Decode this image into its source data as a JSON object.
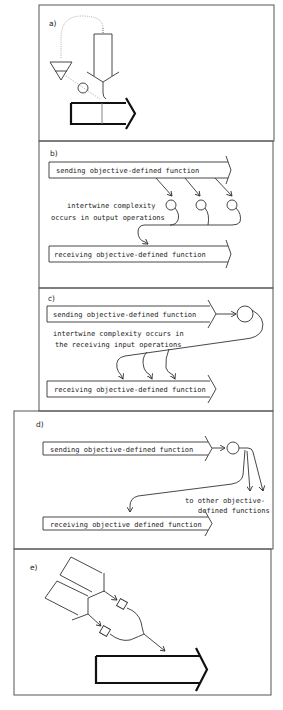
{
  "figure": {
    "colors": {
      "line": "#333333",
      "frame": "#555555",
      "background": "#ffffff"
    },
    "panels": [
      {
        "id": "a",
        "label": "a)"
      },
      {
        "id": "b",
        "label": "b)",
        "sending": "sending objective-defined function",
        "receiving": "receiving objective-defined function",
        "note_line1": "intertwine complexity",
        "note_line2": "occurs in output operations"
      },
      {
        "id": "c",
        "label": "c)",
        "sending": "sending objective-defined function",
        "receiving": "receiving objective-defined function",
        "note_line1": "intertwine complexity occurs in",
        "note_line2": "the receiving input operations"
      },
      {
        "id": "d",
        "label": "d)",
        "sending": "sending objective-defined function",
        "receiving": "receiving objective defined function",
        "note_line1": "to other objective-",
        "note_line2": "defined functions"
      },
      {
        "id": "e",
        "label": "e)"
      }
    ]
  }
}
